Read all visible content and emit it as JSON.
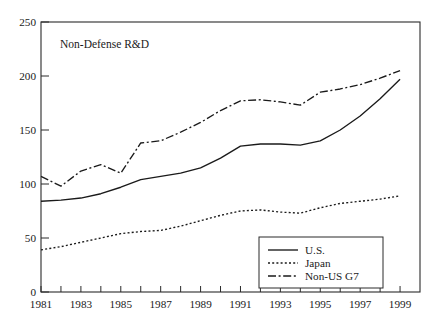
{
  "chart_data": {
    "type": "line",
    "title": "Non-Defense R&D",
    "xlabel": "",
    "ylabel": "",
    "xlim": [
      1981,
      2000
    ],
    "ylim": [
      0,
      250
    ],
    "grid": false,
    "legend_position": "bottom-right",
    "y_ticks": [
      0,
      50,
      100,
      150,
      200,
      250
    ],
    "y_tick_labels": [
      "0",
      "50",
      "100",
      "150",
      "200",
      "250"
    ],
    "x_ticks": [
      1981,
      1982,
      1983,
      1984,
      1985,
      1986,
      1987,
      1988,
      1989,
      1990,
      1991,
      1992,
      1993,
      1994,
      1995,
      1996,
      1997,
      1998,
      1999
    ],
    "x_tick_labels_shown": [
      "1981",
      "1983",
      "1985",
      "1987",
      "1989",
      "1991",
      "1993",
      "1995",
      "1997",
      "1999"
    ],
    "x": [
      1981,
      1982,
      1983,
      1984,
      1985,
      1986,
      1987,
      1988,
      1989,
      1990,
      1991,
      1992,
      1993,
      1994,
      1995,
      1996,
      1997,
      1998,
      1999
    ],
    "series": [
      {
        "name": "U.S.",
        "dash": "solid",
        "values": [
          84,
          85,
          87,
          91,
          97,
          104,
          107,
          110,
          115,
          124,
          135,
          137,
          137,
          136,
          140,
          150,
          163,
          179,
          197
        ]
      },
      {
        "name": "Japan",
        "dash": "dotted",
        "values": [
          39,
          42,
          46,
          50,
          54,
          56,
          57,
          61,
          66,
          71,
          75,
          76,
          74,
          73,
          78,
          82,
          84,
          86,
          89
        ]
      },
      {
        "name": "Non-US G7",
        "dash": "dashdot",
        "values": [
          107,
          98,
          112,
          118,
          110,
          138,
          140,
          148,
          157,
          168,
          177,
          178,
          176,
          173,
          185,
          188,
          192,
          198,
          205
        ]
      }
    ]
  },
  "legend": {
    "entries": [
      {
        "label": "U.S.",
        "dash": "solid"
      },
      {
        "label": "Japan",
        "dash": "dotted"
      },
      {
        "label": "Non-US G7",
        "dash": "dashdot"
      }
    ]
  },
  "caption": {
    "partial_text": ""
  }
}
